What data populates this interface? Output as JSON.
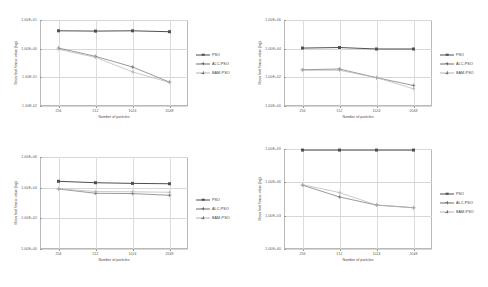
{
  "figure": {
    "type": "multi-panel-line-chart",
    "panels": 4,
    "layout": "2x2",
    "background": "#ffffff"
  },
  "common": {
    "xlabel": "Number of particles",
    "ylabel": "Mean final fitness value (log)",
    "categories": [
      "256",
      "512",
      "1024",
      "2048"
    ],
    "legend_entries": [
      "PSO",
      "ALC-PSO",
      "BAM-PSO"
    ],
    "colors": {
      "pso": "#4f4f4f",
      "alc_pso": "#6f6f6f",
      "bam_pso": "#b3b3b3",
      "grid": "#d7d7d7",
      "axis": "#b9b9b9",
      "text": "#4a4a4a"
    }
  },
  "chart_data": [
    {
      "type": "line",
      "panel": "top-left",
      "title": "",
      "xlabel": "Number of particles",
      "ylabel": "Mean final fitness value (log)",
      "categories": [
        "256",
        "512",
        "1024",
        "2048"
      ],
      "yscale": "log",
      "ylim": [
        0.01,
        10
      ],
      "yticks": [
        "1.00E-02",
        "1.00E-01",
        "1.00E+00",
        "1.00E+01"
      ],
      "ytick_values": [
        0.01,
        0.1,
        1,
        10
      ],
      "grid": true,
      "legend_position": "right",
      "series": [
        {
          "name": "PSO",
          "values": [
            4.2,
            4.1,
            4.2,
            3.9
          ]
        },
        {
          "name": "ALC-PSO",
          "values": [
            1.05,
            0.54,
            0.23,
            0.068
          ]
        },
        {
          "name": "BAM-PSO",
          "values": [
            0.95,
            0.5,
            0.155,
            0.066
          ]
        }
      ]
    },
    {
      "type": "line",
      "panel": "top-right",
      "title": "",
      "xlabel": "Number of particles",
      "ylabel": "Mean final fitness value (log)",
      "categories": [
        "256",
        "512",
        "1024",
        "2048"
      ],
      "yscale": "log",
      "ylim": [
        1,
        1000000
      ],
      "yticks": [
        "1.00E+00",
        "1.00E+02",
        "1.00E+04",
        "1.00E+06"
      ],
      "ytick_values": [
        1,
        100,
        10000,
        1000000
      ],
      "grid": true,
      "legend_position": "right",
      "series": [
        {
          "name": "PSO",
          "values": [
            11000,
            12000,
            9500,
            9500
          ]
        },
        {
          "name": "ALC-PSO",
          "values": [
            340,
            380,
            95,
            27
          ]
        },
        {
          "name": "BAM-PSO",
          "values": [
            310,
            310,
            95,
            16
          ]
        }
      ]
    },
    {
      "type": "line",
      "panel": "bottom-left",
      "title": "",
      "xlabel": "Number of particles",
      "ylabel": "Mean final fitness value (log)",
      "categories": [
        "256",
        "512",
        "1024",
        "2048"
      ],
      "yscale": "log",
      "ylim": [
        1,
        1000000
      ],
      "yticks": [
        "1.00E+00",
        "1.00E+02",
        "1.00E+04",
        "1.00E+06"
      ],
      "ytick_values": [
        1,
        100,
        10000,
        1000000
      ],
      "grid": true,
      "legend_position": "right",
      "series": [
        {
          "name": "PSO",
          "values": [
            26000,
            21000,
            19000,
            18000
          ]
        },
        {
          "name": "ALC-PSO",
          "values": [
            8200,
            4300,
            4100,
            3200
          ]
        },
        {
          "name": "BAM-PSO",
          "values": [
            8500,
            5600,
            5400,
            5000
          ]
        }
      ]
    },
    {
      "type": "line",
      "panel": "bottom-right",
      "title": "",
      "xlabel": "Number of particles",
      "ylabel": "Mean final fitness value (log)",
      "categories": [
        "256",
        "512",
        "1024",
        "2048"
      ],
      "yscale": "log",
      "ylim": [
        1,
        1000000000
      ],
      "yticks": [
        "1.00E+00",
        "1.00E+03",
        "1.00E+06",
        "1.00E+09"
      ],
      "ytick_values": [
        1,
        1000,
        1000000,
        1000000000
      ],
      "grid": true,
      "legend_position": "right",
      "series": [
        {
          "name": "PSO",
          "values": [
            800000000,
            800000000,
            800000000,
            800000000
          ]
        },
        {
          "name": "ALC-PSO",
          "values": [
            560000,
            48000,
            9000,
            5200
          ]
        },
        {
          "name": "BAM-PSO",
          "values": [
            620000,
            120000,
            9000,
            5200
          ]
        }
      ]
    }
  ]
}
